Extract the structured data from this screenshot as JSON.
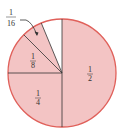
{
  "diagram": {
    "type": "pie-fraction",
    "colors": {
      "fill": "#f3c4c4",
      "stroke": "#e0605a",
      "lines": "#333333",
      "empty": "#ffffff"
    },
    "slices": [
      {
        "label_num": "1",
        "label_den": "2",
        "fraction": 0.5,
        "filled": true
      },
      {
        "label_num": "1",
        "label_den": "4",
        "fraction": 0.25,
        "filled": true
      },
      {
        "label_num": "1",
        "label_den": "8",
        "fraction": 0.125,
        "filled": true
      },
      {
        "label_num": "1",
        "label_den": "16",
        "fraction": 0.0625,
        "filled": true
      },
      {
        "label_num": "",
        "label_den": "",
        "fraction": 0.0625,
        "filled": false
      }
    ],
    "callout": {
      "num": "1",
      "den": "16"
    }
  }
}
